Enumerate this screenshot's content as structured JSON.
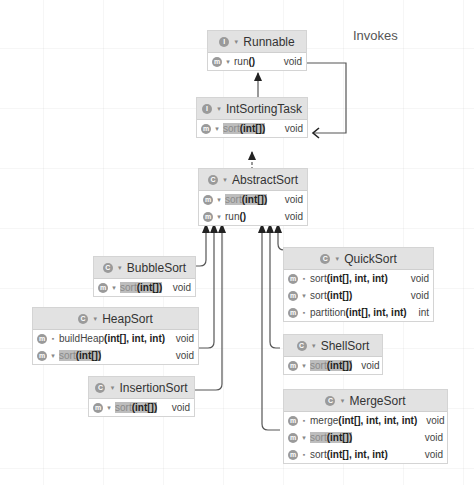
{
  "diagram": {
    "edge_label": "Invokes",
    "colors": {
      "header_bg": "#e2e2e2",
      "border": "#d4d4d4",
      "highlight": "#bdbdbd",
      "line": "#555555",
      "badge": "#9a9a9a"
    },
    "nodes": {
      "runnable": {
        "kind": "I",
        "name": "Runnable",
        "members": [
          {
            "badge": "m",
            "vis": "public",
            "name": "run",
            "params": "()",
            "return": "void",
            "highlight": false
          }
        ]
      },
      "intsortingtask": {
        "kind": "I",
        "name": "IntSortingTask",
        "members": [
          {
            "badge": "m",
            "vis": "public",
            "name": "sort",
            "params": "(int[])",
            "return": "void",
            "highlight": true
          }
        ]
      },
      "abstractsort": {
        "kind": "C",
        "name": "AbstractSort",
        "members": [
          {
            "badge": "m",
            "vis": "public",
            "name": "sort",
            "params": "(int[])",
            "return": "void",
            "highlight": true
          },
          {
            "badge": "m",
            "vis": "public",
            "name": "run",
            "params": "()",
            "return": "void",
            "highlight": false
          }
        ]
      },
      "bubblesort": {
        "kind": "C",
        "name": "BubbleSort",
        "members": [
          {
            "badge": "m",
            "vis": "public",
            "name": "sort",
            "params": "(int[])",
            "return": "void",
            "highlight": true
          }
        ]
      },
      "heapsort": {
        "kind": "C",
        "name": "HeapSort",
        "members": [
          {
            "badge": "m",
            "vis": "private",
            "name": "buildHeap",
            "params": "(int[], int, int)",
            "return": "void",
            "highlight": false
          },
          {
            "badge": "m",
            "vis": "public",
            "name": "sort",
            "params": "(int[])",
            "return": "void",
            "highlight": true
          }
        ]
      },
      "insertionsort": {
        "kind": "C",
        "name": "InsertionSort",
        "members": [
          {
            "badge": "m",
            "vis": "public",
            "name": "sort",
            "params": "(int[])",
            "return": "void",
            "highlight": true
          }
        ]
      },
      "quicksort": {
        "kind": "C",
        "name": "QuickSort",
        "members": [
          {
            "badge": "m",
            "vis": "private",
            "name": "sort",
            "params": "(int[], int, int)",
            "return": "void",
            "highlight": false
          },
          {
            "badge": "m",
            "vis": "public",
            "name": "sort",
            "params": "(int[])",
            "return": "void",
            "highlight": false
          },
          {
            "badge": "m",
            "vis": "private",
            "name": "partition",
            "params": "(int[], int, int)",
            "return": "int",
            "highlight": false
          }
        ]
      },
      "shellsort": {
        "kind": "C",
        "name": "ShellSort",
        "members": [
          {
            "badge": "m",
            "vis": "public",
            "name": "sort",
            "params": "(int[])",
            "return": "void",
            "highlight": true
          }
        ]
      },
      "mergesort": {
        "kind": "C",
        "name": "MergeSort",
        "members": [
          {
            "badge": "m",
            "vis": "private",
            "name": "merge",
            "params": "(int[], int, int, int)",
            "return": "void",
            "highlight": false
          },
          {
            "badge": "m",
            "vis": "public",
            "name": "sort",
            "params": "(int[])",
            "return": "void",
            "highlight": true
          },
          {
            "badge": "m",
            "vis": "private",
            "name": "sort",
            "params": "(int[], int, int)",
            "return": "void",
            "highlight": false
          }
        ]
      }
    }
  }
}
